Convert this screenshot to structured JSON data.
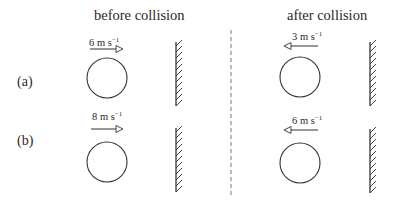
{
  "diagram": {
    "columns": {
      "before": "before collision",
      "after": "after collision"
    },
    "rows": [
      {
        "label": "(a)",
        "before": {
          "speed": "6",
          "unit": "m s",
          "exponent": "−1",
          "direction": "right"
        },
        "after": {
          "speed": "3",
          "unit": "m s",
          "exponent": "−1",
          "direction": "left"
        }
      },
      {
        "label": "(b)",
        "before": {
          "speed": "8",
          "unit": "m s",
          "exponent": "−1",
          "direction": "right"
        },
        "after": {
          "speed": "6",
          "unit": "m s",
          "exponent": "−1",
          "direction": "left"
        }
      }
    ],
    "elements": {
      "ball": "circle",
      "wall": "hatched-wall",
      "divider": "dashed-line"
    },
    "colors": {
      "ink": "#333333",
      "background": "#ffffff"
    }
  }
}
